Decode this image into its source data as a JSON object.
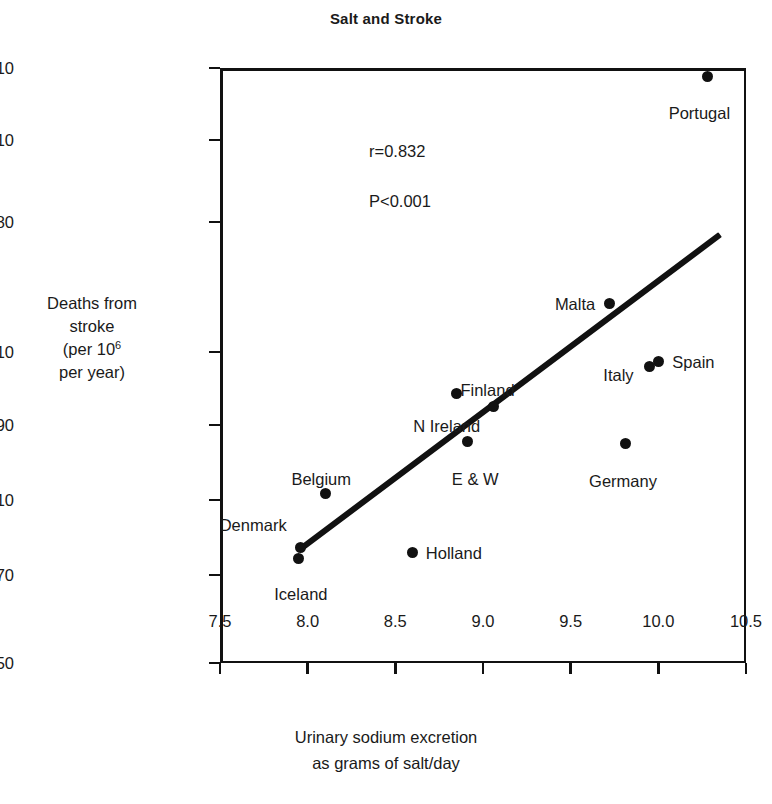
{
  "chart_data": {
    "type": "scatter",
    "title": "Salt and Stroke",
    "xlabel": "Urinary sodium excretion as grams of salt/day",
    "xlabel_line1": "Urinary sodium excretion",
    "xlabel_line2": "as grams of salt/day",
    "ylabel": "Deaths from stroke (per 10^6 per year)",
    "ylabel_line1": "Deaths from",
    "ylabel_line2": "stroke",
    "ylabel_line3_pre": "(per 10",
    "ylabel_line3_sup": "6",
    "ylabel_line4": "per year)",
    "xlim": [
      7.5,
      10.5
    ],
    "ylim": [
      550,
      2210
    ],
    "grid": false,
    "legend": "none",
    "xticks": [
      "7.5",
      "8.0",
      "8.5",
      "9.0",
      "9.5",
      "10.0",
      "10.5"
    ],
    "xtick_values": [
      7.5,
      8.0,
      8.5,
      9.0,
      9.5,
      10.0,
      10.5
    ],
    "yticks": [
      "2210",
      "1810",
      "1480",
      "1210",
      "990",
      "810",
      "670",
      "550"
    ],
    "ytick_values": [
      2210,
      1810,
      1480,
      1210,
      990,
      810,
      670,
      550
    ],
    "annotations": [
      {
        "text": "r=0.832",
        "x": 8.35,
        "y": 1760
      },
      {
        "text": "P<0.001",
        "x": 8.35,
        "y": 1560
      }
    ],
    "correlation": "r=0.832",
    "pvalue": "P<0.001",
    "points": [
      {
        "label": "Portugal",
        "x": 10.28,
        "y": 2165,
        "label_side": "below"
      },
      {
        "label": "Malta",
        "x": 9.72,
        "y": 1310,
        "label_side": "left"
      },
      {
        "label": "Spain",
        "x": 10.0,
        "y": 1180,
        "label_side": "right"
      },
      {
        "label": "Italy",
        "x": 9.95,
        "y": 1165,
        "label_side": "left"
      },
      {
        "label": "Finland",
        "x": 9.06,
        "y": 1045,
        "label_side": "above"
      },
      {
        "label": "N Ireland",
        "x": 8.85,
        "y": 1085,
        "label_side": "below-left"
      },
      {
        "label": "E & W",
        "x": 8.91,
        "y": 950,
        "label_side": "below"
      },
      {
        "label": "Germany",
        "x": 9.81,
        "y": 945,
        "label_side": "below"
      },
      {
        "label": "Belgium",
        "x": 8.1,
        "y": 825,
        "label_side": "above"
      },
      {
        "label": "Denmark",
        "x": 7.96,
        "y": 722,
        "label_side": "left"
      },
      {
        "label": "Iceland",
        "x": 7.95,
        "y": 700,
        "label_side": "below"
      },
      {
        "label": "Holland",
        "x": 8.6,
        "y": 712,
        "label_side": "right"
      }
    ],
    "trendline": {
      "x_start": 7.95,
      "y_start": 718,
      "x_end": 10.35,
      "y_end": 1455
    }
  }
}
